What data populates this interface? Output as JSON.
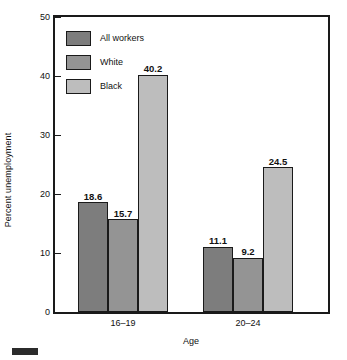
{
  "chart_data": {
    "type": "bar",
    "title": "",
    "xlabel": "Age",
    "ylabel": "Percent unemployment",
    "categories": [
      "16–19",
      "20–24"
    ],
    "series": [
      {
        "name": "All workers",
        "values": [
          18.6,
          11.1
        ],
        "color": "#7d7d7d"
      },
      {
        "name": "White",
        "values": [
          15.7,
          9.2
        ],
        "color": "#949494"
      },
      {
        "name": "Black",
        "values": [
          40.2,
          24.5
        ],
        "color": "#bdbdbd"
      }
    ],
    "ylim": [
      0,
      50
    ],
    "yticks": [
      0,
      10,
      20,
      30,
      40,
      50
    ],
    "ytick_labels": [
      "0",
      "10",
      "20",
      "30",
      "40",
      "50"
    ],
    "grid": false,
    "legend_position": "top-left",
    "data_labels": [
      "18.6",
      "15.7",
      "40.2",
      "11.1",
      "9.2",
      "24.5"
    ],
    "axis_color": "#1a1a1a",
    "bar_edge_color": "#1a1a1a",
    "background": "#ffffff"
  },
  "legend": {
    "items": [
      {
        "label": "All workers",
        "color": "#7d7d7d"
      },
      {
        "label": "White",
        "color": "#949494"
      },
      {
        "label": "Black",
        "color": "#bdbdbd"
      }
    ]
  }
}
